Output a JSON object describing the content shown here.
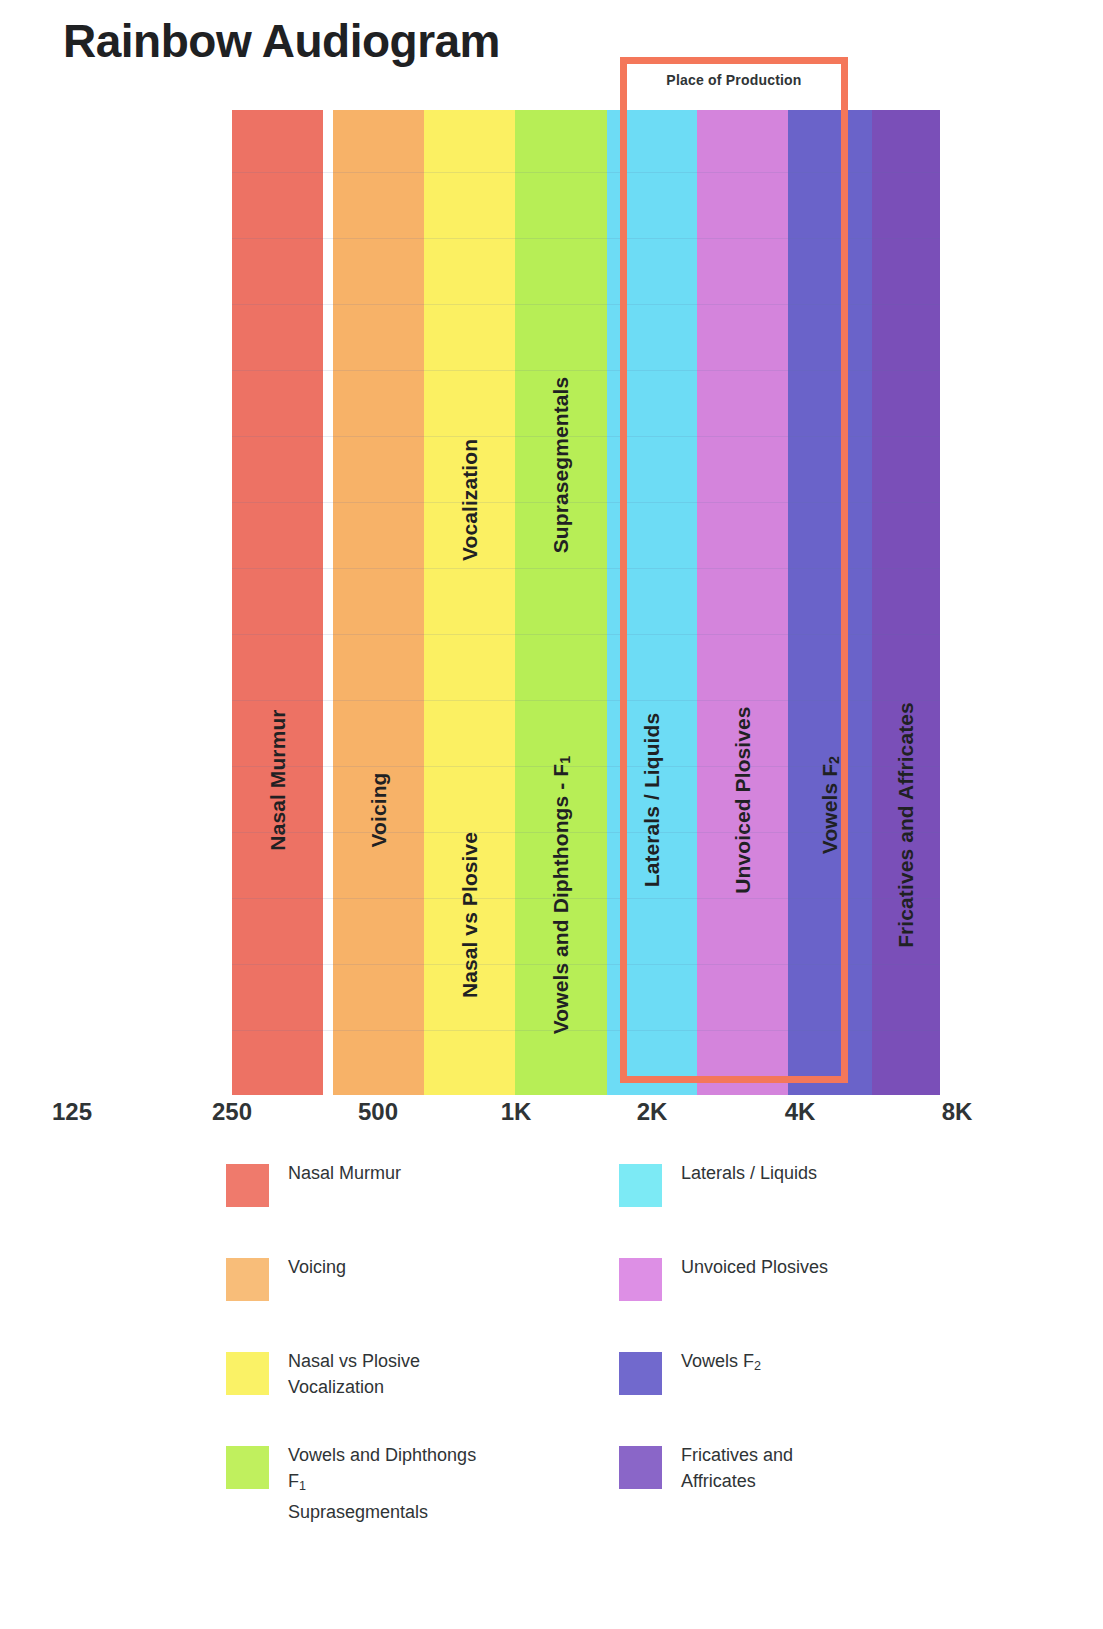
{
  "title": "Rainbow Audiogram",
  "highlight": {
    "label": "Place of Production",
    "color": "#f4775a"
  },
  "axis": {
    "ticks": [
      "125",
      "250",
      "500",
      "1K",
      "2K",
      "4K",
      "8K"
    ]
  },
  "bands": [
    {
      "id": "nasal-murmur",
      "label": "Nasal Murmur",
      "color": "#ed7264",
      "left": 232,
      "width": 91
    },
    {
      "id": "voicing",
      "label": "Voicing",
      "color": "#f7b268",
      "left": 333,
      "width": 91
    },
    {
      "id": "nasal-vs-plosive",
      "label": "Nasal vs Plosive",
      "color": "#fbf062",
      "left": 424,
      "width": 91
    },
    {
      "id": "vowels-diphthongs-f1",
      "label": "Vowels and Diphthongs - F",
      "color": "#b7ee56",
      "left": 515,
      "width": 92
    },
    {
      "id": "laterals-liquids",
      "label": "Laterals / Liquids",
      "color": "#6ddcf5",
      "left": 607,
      "width": 90
    },
    {
      "id": "unvoiced-plosives",
      "label": "Unvoiced Plosives",
      "color": "#d484dc",
      "left": 697,
      "width": 91
    },
    {
      "id": "vowels-f2",
      "label": "Vowels F",
      "color": "#6a63c9",
      "left": 788,
      "width": 84
    },
    {
      "id": "fricatives-affricates",
      "label": "Fricatives and Affricates",
      "color": "#7a4fb8",
      "left": 872,
      "width": 68
    }
  ],
  "band_extra_labels": [
    {
      "id": "vocalization",
      "label": "Vocalization",
      "band_left": 424,
      "band_width": 91,
      "top": 500
    },
    {
      "id": "suprasegmentals",
      "label": "Suprasegmentals",
      "band_left": 515,
      "band_width": 92,
      "top": 465
    }
  ],
  "band_label_positions": {
    "nasal-murmur": 670,
    "voicing": 700,
    "nasal-vs-plosive": 805,
    "vowels-diphthongs-f1": 785,
    "laterals-liquids": 690,
    "unvoiced-plosives": 690,
    "vowels-f2": 695,
    "fricatives-affricates": 715
  },
  "legend": {
    "left_column": [
      {
        "id": "nasal-murmur",
        "color": "#ef7a6c",
        "lines": [
          "Nasal Murmur"
        ]
      },
      {
        "id": "voicing",
        "color": "#f8bd79",
        "lines": [
          "Voicing"
        ]
      },
      {
        "id": "nasal-vs-plosive",
        "color": "#faf266",
        "lines": [
          "Nasal vs Plosive",
          "Vocalization"
        ]
      },
      {
        "id": "vowels-and-diphthongs",
        "color": "#c0f05e",
        "lines": [
          "Vowels and Diphthongs",
          "F₁",
          "Suprasegmentals"
        ]
      }
    ],
    "right_column": [
      {
        "id": "laterals-liquids",
        "color": "#7ceaf5",
        "lines": [
          "Laterals / Liquids"
        ]
      },
      {
        "id": "unvoiced-plosives",
        "color": "#dd8fe5",
        "lines": [
          "Unvoiced Plosives"
        ]
      },
      {
        "id": "vowels-f2",
        "color": "#7169cd",
        "lines": [
          "Vowels F₂"
        ]
      },
      {
        "id": "fricatives-affricates",
        "color": "#8a66c8",
        "lines": [
          "Fricatives and",
          "Affricates"
        ]
      }
    ]
  },
  "chart_data": {
    "type": "bar",
    "title": "Rainbow Audiogram",
    "xlabel": "",
    "ylabel": "",
    "grid": true,
    "legend_position": "bottom",
    "x_axis_type": "log-frequency (Hz)",
    "x_tick_labels": [
      "125",
      "250",
      "500",
      "1K",
      "2K",
      "4K",
      "8K"
    ],
    "x_tick_values": [
      125,
      250,
      500,
      1000,
      2000,
      4000,
      8000
    ],
    "categories": [
      "Nasal Murmur",
      "Voicing",
      "Nasal vs Plosive / Vocalization",
      "Vowels and Diphthongs - F1 / Suprasegmentals",
      "Laterals / Liquids",
      "Unvoiced Plosives",
      "Vowels F2",
      "Fricatives and Affricates"
    ],
    "series": [
      {
        "name": "Speech sound frequency bands",
        "bands": [
          {
            "label": "Nasal Murmur",
            "freq_start_hz": 250,
            "freq_end_hz": 350,
            "color": "#ed7264"
          },
          {
            "label": "Voicing",
            "freq_start_hz": 380,
            "freq_end_hz": 500,
            "color": "#f7b268"
          },
          {
            "label": "Nasal vs Plosive / Vocalization",
            "freq_start_hz": 500,
            "freq_end_hz": 750,
            "color": "#fbf062"
          },
          {
            "label": "Vowels and Diphthongs - F1 / Suprasegmentals",
            "freq_start_hz": 750,
            "freq_end_hz": 1200,
            "color": "#b7ee56"
          },
          {
            "label": "Laterals / Liquids",
            "freq_start_hz": 1200,
            "freq_end_hz": 1900,
            "color": "#6ddcf5"
          },
          {
            "label": "Unvoiced Plosives",
            "freq_start_hz": 1900,
            "freq_end_hz": 2900,
            "color": "#d484dc"
          },
          {
            "label": "Vowels F2",
            "freq_start_hz": 2900,
            "freq_end_hz": 4200,
            "color": "#6a63c9"
          },
          {
            "label": "Fricatives and Affricates",
            "freq_start_hz": 4200,
            "freq_end_hz": 6500,
            "color": "#7a4fb8"
          }
        ]
      }
    ],
    "annotations": [
      {
        "text": "Place of Production",
        "freq_start_hz": 1600,
        "freq_end_hz": 3800,
        "color": "#f4775a"
      }
    ]
  }
}
